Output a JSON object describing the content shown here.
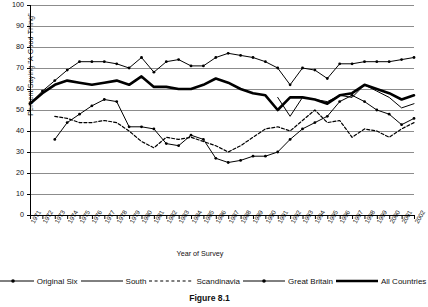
{
  "figure": {
    "caption": "Figure 8.1"
  },
  "chart_data": {
    "type": "line",
    "title": "",
    "xlabel": "Year of Survey",
    "ylabel": "Percent Saying \"A Good Thing\"",
    "ylim": [
      0,
      100
    ],
    "ytick_step": 10,
    "yticks": [
      "0",
      "10",
      "20",
      "30",
      "40",
      "50",
      "60",
      "70",
      "80",
      "90",
      "100"
    ],
    "grid": "horizontal",
    "legend_position": "bottom",
    "x": [
      1971,
      1972,
      1973,
      1974,
      1975,
      1976,
      1977,
      1978,
      1979,
      1980,
      1981,
      1982,
      1983,
      1984,
      1985,
      1986,
      1987,
      1988,
      1989,
      1990,
      1991,
      1992,
      1993,
      1994,
      1995,
      1996,
      1997,
      1998,
      1999,
      2000,
      2001,
      2002
    ],
    "categories": [
      "1971",
      "1972",
      "1973",
      "1974",
      "1975",
      "1976",
      "1977",
      "1978",
      "1979",
      "1980",
      "1981",
      "1982",
      "1983",
      "1984",
      "1985",
      "1986",
      "1987",
      "1988",
      "1989",
      "1990",
      "1991",
      "1992",
      "1993",
      "1994",
      "1995",
      "1996",
      "1997",
      "1998",
      "1999",
      "2000",
      "2001",
      "2002"
    ],
    "series": [
      {
        "name": "Original Six",
        "style": "solid-thin-marker",
        "values": [
          53,
          59,
          64,
          69,
          73,
          73,
          73,
          72,
          70,
          75,
          68,
          73,
          74,
          71,
          71,
          75,
          77,
          76,
          75,
          73,
          70,
          62,
          70,
          69,
          65,
          72,
          72,
          73,
          73,
          73,
          74,
          75
        ]
      },
      {
        "name": "South",
        "style": "solid-thin",
        "values": [
          null,
          null,
          null,
          null,
          null,
          null,
          null,
          null,
          null,
          null,
          null,
          null,
          null,
          null,
          null,
          null,
          null,
          null,
          null,
          null,
          56,
          47,
          56,
          55,
          54,
          57,
          56,
          62,
          59,
          56,
          51,
          53
        ]
      },
      {
        "name": "Scandinavia",
        "style": "dashed",
        "values": [
          null,
          null,
          47,
          46,
          44,
          44,
          45,
          44,
          40,
          35,
          32,
          37,
          36,
          37,
          35,
          33,
          30,
          33,
          37,
          41,
          42,
          40,
          45,
          50,
          44,
          45,
          37,
          41,
          40,
          37,
          41,
          44
        ]
      },
      {
        "name": "Great Britain",
        "style": "solid-thin-marker",
        "values": [
          null,
          null,
          36,
          44,
          48,
          52,
          55,
          54,
          42,
          42,
          41,
          34,
          33,
          38,
          36,
          27,
          25,
          26,
          28,
          28,
          30,
          36,
          41,
          44,
          47,
          54,
          57,
          54,
          50,
          48,
          43,
          46
        ]
      },
      {
        "name": "All Countries",
        "style": "solid-thick",
        "values": [
          53,
          58,
          62,
          64,
          63,
          62,
          63,
          64,
          62,
          66,
          61,
          61,
          60,
          60,
          62,
          65,
          63,
          60,
          58,
          57,
          50,
          56,
          56,
          55,
          53,
          57,
          58,
          62,
          60,
          58,
          55,
          57
        ]
      }
    ]
  },
  "legend": [
    {
      "label": "Original Six",
      "style": "solid-thin-marker"
    },
    {
      "label": "South",
      "style": "solid-thin"
    },
    {
      "label": "Scandinavia",
      "style": "dashed"
    },
    {
      "label": "Great Britain",
      "style": "solid-thin-marker"
    },
    {
      "label": "All Countries",
      "style": "solid-thick"
    }
  ],
  "colors": {
    "ink": "#000000",
    "grid": "#8c8c8c",
    "background": "#ffffff"
  }
}
